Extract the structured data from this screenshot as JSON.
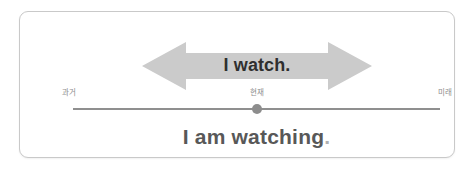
{
  "card": {
    "background_color": "#ffffff",
    "border_color": "#c9c9c9"
  },
  "arrow": {
    "icon": "double-headed-horizontal-arrow-icon",
    "fill_color": "#cbcbcb",
    "direction": "both"
  },
  "main": {
    "arrow_text": "I watch.",
    "arrow_text_color": "#2f2f2f",
    "bottom_text": "I am watching",
    "bottom_period": ".",
    "bottom_text_color": "#585858"
  },
  "timeline": {
    "line_color": "#8f8f8f",
    "dot_color": "#8d8d8d",
    "label_color": "#8d8d8d",
    "labels": [
      {
        "key": "past",
        "text": "과거"
      },
      {
        "key": "present",
        "text": "현재"
      },
      {
        "key": "future",
        "text": "미래"
      }
    ]
  }
}
